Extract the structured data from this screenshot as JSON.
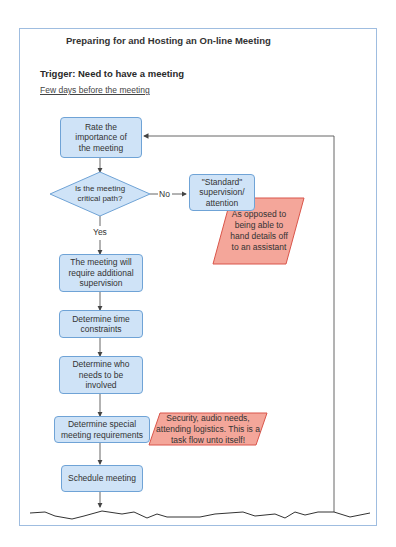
{
  "diagram": {
    "title": "Preparing for and Hosting an On-line Meeting",
    "trigger": "Trigger: Need to have a meeting",
    "phase": "Few days before the meeting",
    "steps": [
      {
        "id": "rate",
        "label": "Rate the importance of the meeting",
        "type": "process"
      },
      {
        "id": "decision",
        "label": "Is the meeting critical path?",
        "type": "decision"
      },
      {
        "id": "standard",
        "label": "\"Standard\" supervision/ attention",
        "type": "process"
      },
      {
        "id": "additional",
        "label": "The meeting will require additional supervision",
        "type": "process"
      },
      {
        "id": "time",
        "label": "Determine time constraints",
        "type": "process"
      },
      {
        "id": "who",
        "label": "Determine who needs to be involved",
        "type": "process"
      },
      {
        "id": "special",
        "label": "Determine special meeting requirements",
        "type": "process"
      },
      {
        "id": "schedule",
        "label": "Schedule meeting",
        "type": "process"
      }
    ],
    "edge_labels": {
      "no": "No",
      "yes": "Yes"
    },
    "notes": [
      {
        "attached_to": "standard",
        "text": "As opposed to being able to hand details off to an assistant"
      },
      {
        "attached_to": "special",
        "text": "Security, audio needs, attending logistics.  This is a task flow unto itself!"
      }
    ],
    "colors": {
      "process_fill": "#cfe3f7",
      "process_border": "#6fa3d6",
      "note_fill": "#f4a69a",
      "note_border": "#d9554a",
      "frame_border": "#9fbde0"
    }
  }
}
